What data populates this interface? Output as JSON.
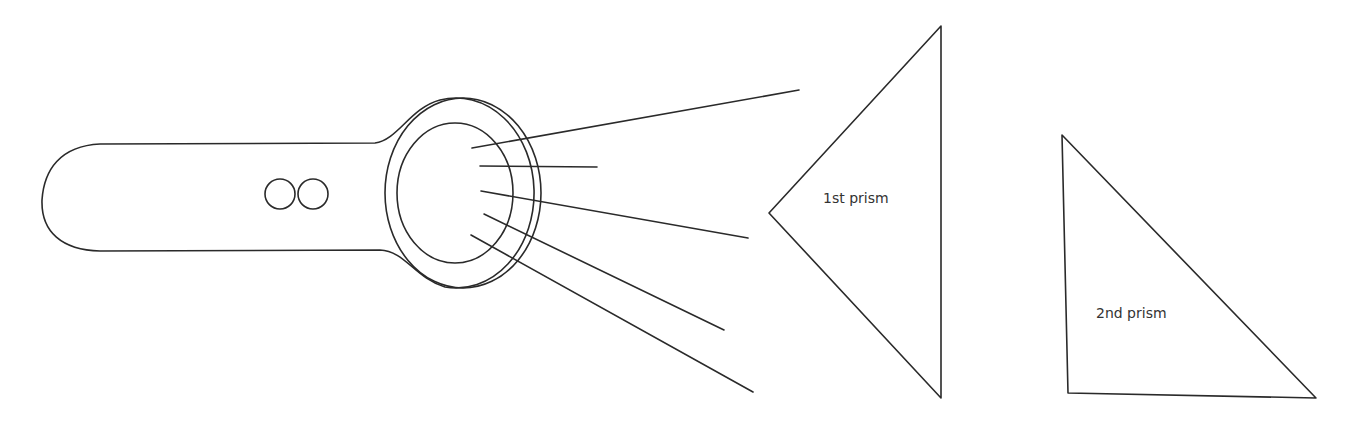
{
  "diagram": {
    "type": "flashlight-prism-setup",
    "colors": {
      "stroke": "#2a2a2a",
      "text": "#333333",
      "background": "#ffffff"
    },
    "flashlight": {
      "handle": {
        "left_x": 42,
        "top_y": 143,
        "bottom_y": 251
      },
      "buttons": [
        {
          "name": "button-1",
          "cx": 280,
          "cy": 194,
          "r": 15
        },
        {
          "name": "button-2",
          "cx": 313,
          "cy": 194,
          "r": 15
        }
      ],
      "head_outer": {
        "cx": 463,
        "cy": 193,
        "rx": 78,
        "ry": 95
      },
      "lens": {
        "cx": 455,
        "cy": 193,
        "rx": 58,
        "ry": 70
      }
    },
    "rays": [
      {
        "x1": 472,
        "y1": 148,
        "x2": 799,
        "y2": 90
      },
      {
        "x1": 480,
        "y1": 166,
        "x2": 597,
        "y2": 167
      },
      {
        "x1": 481,
        "y1": 191,
        "x2": 748,
        "y2": 238
      },
      {
        "x1": 484,
        "y1": 214,
        "x2": 724,
        "y2": 330
      },
      {
        "x1": 471,
        "y1": 235,
        "x2": 753,
        "y2": 392
      }
    ],
    "prisms": [
      {
        "label": "1st prism",
        "points": "941,26 769,213 941,398",
        "label_x": 823,
        "label_y": 203
      },
      {
        "label": "2nd prism",
        "points": "1062,135 1068,393 1316,398",
        "label_x": 1096,
        "label_y": 318
      }
    ]
  }
}
